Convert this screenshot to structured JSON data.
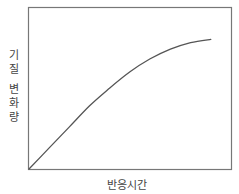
{
  "chart_data": {
    "type": "line",
    "title": "",
    "xlabel": "반응시간",
    "ylabel": "기질 변화량",
    "ylabel_lines": [
      "기",
      "질",
      "변",
      "화",
      "량"
    ],
    "grid": false,
    "legend": null,
    "ticks": {
      "x": [],
      "y": []
    },
    "xlim": [
      0,
      1
    ],
    "ylim": [
      0,
      1
    ],
    "series": [
      {
        "name": "기질 변화량",
        "color": "#555555",
        "x": [
          0.0,
          0.1,
          0.2,
          0.3,
          0.4,
          0.5,
          0.6,
          0.7,
          0.8,
          0.9,
          0.9
        ],
        "y": [
          0.0,
          0.13,
          0.26,
          0.39,
          0.5,
          0.6,
          0.68,
          0.74,
          0.78,
          0.8,
          0.8
        ]
      }
    ]
  },
  "colors": {
    "frame": "#777777",
    "curve": "#555555",
    "text": "#444444"
  }
}
